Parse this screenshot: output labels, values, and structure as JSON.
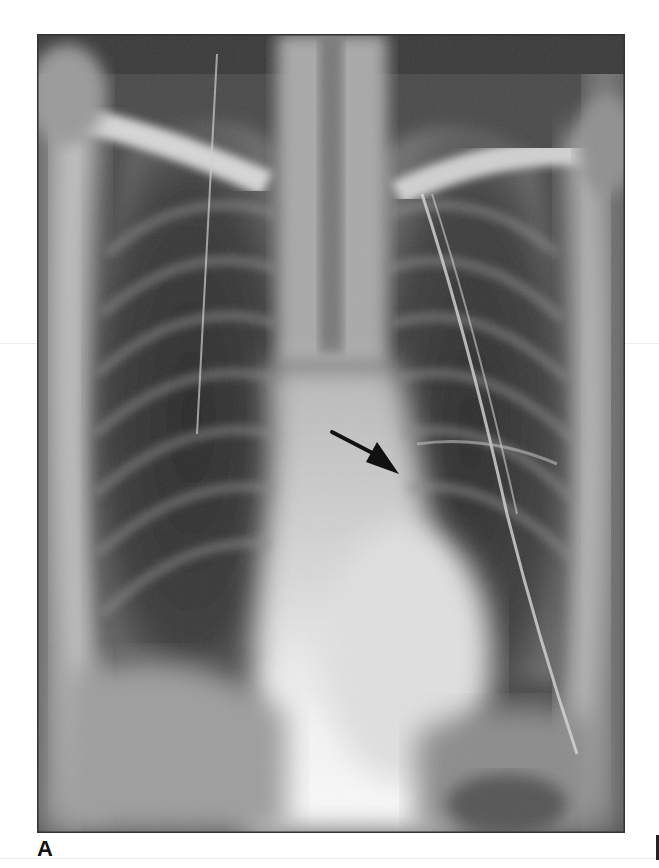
{
  "figure": {
    "panel_label": "A",
    "annotation": {
      "type": "arrow",
      "direction": "down-right",
      "color": "#111111"
    },
    "colors": {
      "background": "#ffffff",
      "film_dark": "#2e2e2e",
      "film_bright": "#f5f5f5"
    }
  }
}
